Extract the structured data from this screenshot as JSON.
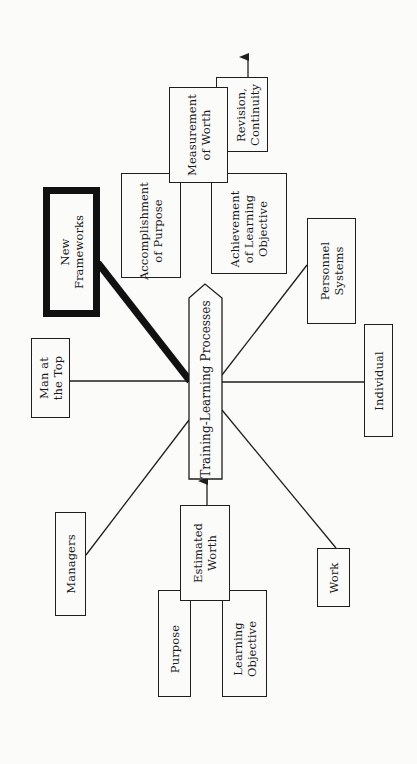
{
  "diagram": {
    "orientation": "rotated-90-ccw",
    "center": {
      "label": "Training-Learning Processes"
    },
    "nodes": {
      "man_at_top": {
        "lines": [
          "Man at",
          "the Top"
        ]
      },
      "new_frameworks": {
        "lines": [
          "New",
          "Frameworks"
        ],
        "emphasis": "thick-border"
      },
      "managers": {
        "lines": [
          "Managers"
        ]
      },
      "work": {
        "lines": [
          "Work"
        ]
      },
      "individual": {
        "lines": [
          "Individual"
        ]
      },
      "personnel_systems": {
        "lines": [
          "Personnel",
          "Systems"
        ]
      },
      "estimated_worth": {
        "lines": [
          "Estimated",
          "Worth"
        ]
      },
      "purpose": {
        "lines": [
          "Purpose"
        ]
      },
      "learning_objective": {
        "lines": [
          "Learning",
          "Objective"
        ]
      },
      "measurement_of_worth": {
        "lines": [
          "Measurement",
          "of Worth"
        ]
      },
      "accomplishment_of_purpose": {
        "lines": [
          "Accomplishment",
          "of Purpose"
        ]
      },
      "achievement_of_learning_objective": {
        "lines": [
          "Achievement",
          "of Learning",
          "Objective"
        ]
      },
      "revision_continuity": {
        "lines": [
          "Revision,",
          "Continuity"
        ]
      }
    },
    "edges": [
      {
        "from": "man_at_top",
        "to": "center",
        "style": "line"
      },
      {
        "from": "new_frameworks",
        "to": "center",
        "style": "thick-line"
      },
      {
        "from": "managers",
        "to": "center",
        "style": "line"
      },
      {
        "from": "work",
        "to": "center",
        "style": "line"
      },
      {
        "from": "individual",
        "to": "center",
        "style": "line"
      },
      {
        "from": "personnel_systems",
        "to": "center",
        "style": "line"
      },
      {
        "from": "estimated_worth",
        "to": "center",
        "style": "arrow"
      },
      {
        "from": "revision_continuity",
        "to": "outward",
        "style": "arrow"
      }
    ],
    "colors": {
      "ink": "#1e1e1e",
      "paper": "#fbfbfa"
    }
  }
}
